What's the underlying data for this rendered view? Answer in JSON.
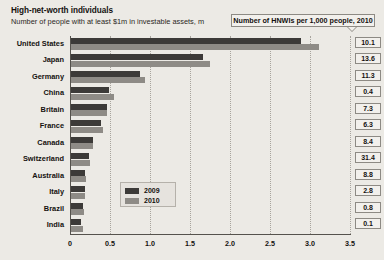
{
  "header": {
    "title": "High-net-worth individuals",
    "subtitle": "Number of people with at least $1m in investable assets, m",
    "callout": "Number of HNWIs per 1,000 people, 2010"
  },
  "legend": {
    "items": [
      {
        "label": "2009",
        "color": "#3c3a38"
      },
      {
        "label": "2010",
        "color": "#8e8b86"
      }
    ]
  },
  "colors": {
    "background": "#eceae5",
    "series_2009": "#3c3a38",
    "series_2010": "#8e8b86",
    "axis": "#55524d",
    "grid": "#a8a49d",
    "box_border": "#8d8a84",
    "box_fill": "#f2f0ec"
  },
  "chart_data": {
    "type": "bar",
    "title": "High-net-worth individuals",
    "subtitle": "Number of people with at least $1m in investable assets, m",
    "orientation": "horizontal",
    "xlabel": "",
    "ylabel": "",
    "xlim": [
      0,
      3.5
    ],
    "xticks": [
      "0",
      "0.5",
      "1.0",
      "1.5",
      "2.0",
      "2.5",
      "3.0",
      "3.5"
    ],
    "xtick_values": [
      0,
      0.5,
      1.0,
      1.5,
      2.0,
      2.5,
      3.0,
      3.5
    ],
    "grid": true,
    "legend_position": "inside-center-bottom",
    "categories": [
      "United States",
      "Japan",
      "Germany",
      "China",
      "Britain",
      "France",
      "Canada",
      "Switzerland",
      "Australia",
      "Italy",
      "Brazil",
      "India"
    ],
    "series": [
      {
        "name": "2009",
        "values": [
          2.87,
          1.65,
          0.86,
          0.48,
          0.45,
          0.38,
          0.28,
          0.22,
          0.17,
          0.17,
          0.15,
          0.13
        ]
      },
      {
        "name": "2010",
        "values": [
          3.1,
          1.74,
          0.92,
          0.54,
          0.45,
          0.4,
          0.28,
          0.24,
          0.19,
          0.17,
          0.16,
          0.15
        ]
      }
    ],
    "annotation_column": {
      "header": "Number of HNWIs per 1,000 people, 2010",
      "values": [
        "10.1",
        "13.6",
        "11.3",
        "0.4",
        "7.3",
        "6.3",
        "8.4",
        "31.4",
        "8.8",
        "2.8",
        "0.8",
        "0.1"
      ]
    }
  }
}
